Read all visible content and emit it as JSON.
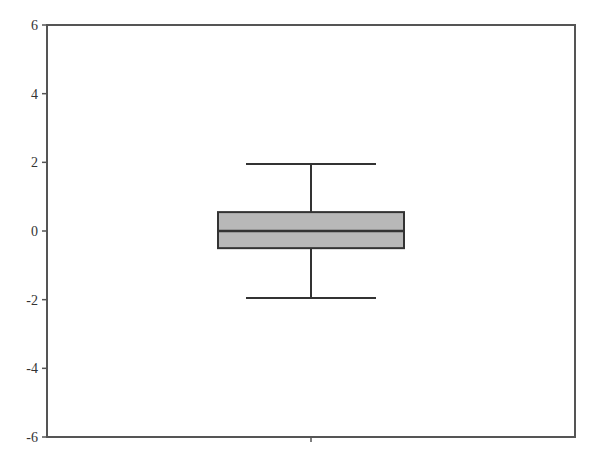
{
  "chart_data": {
    "type": "box",
    "title": "",
    "xlabel": "",
    "ylabel": "",
    "ylim": [
      -6,
      6
    ],
    "yticks": [
      6,
      4,
      2,
      0,
      -2,
      -4,
      -6
    ],
    "ytick_labels": [
      "6",
      "4",
      "2",
      "0",
      "-2",
      "-4",
      "-6"
    ],
    "categories": [
      ""
    ],
    "grid": false,
    "legend": null,
    "series": [
      {
        "name": "",
        "whisker_high": 1.95,
        "q3": 0.55,
        "median": 0.0,
        "q1": -0.5,
        "whisker_low": -1.95,
        "fill_color": "#b8b8b8"
      }
    ]
  },
  "colors": {
    "axis": "#555555",
    "box_fill": "#b8b8b8",
    "line": "#333333"
  }
}
